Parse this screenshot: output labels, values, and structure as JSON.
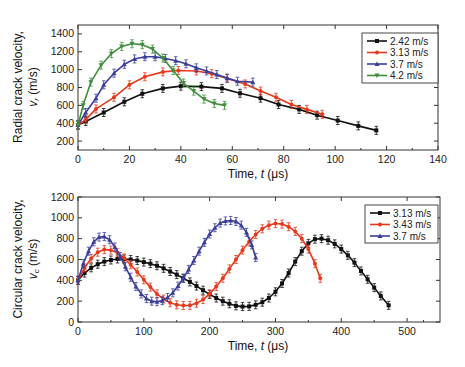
{
  "chart_data": [
    {
      "type": "line",
      "title": "",
      "xlabel": "Time, t (μs)",
      "xlabel_parts": {
        "prefix": "Time, ",
        "var": "t",
        "unit": " (μs)"
      },
      "ylabel": "Radial crack velocity, v_r (m/s)",
      "ylabel_line1": "Radial crack velocity,",
      "ylabel_line2_var": "v",
      "ylabel_line2_sub": "r",
      "ylabel_line2_unit": " (m/s)",
      "xlim": [
        0,
        140
      ],
      "ylim": [
        100,
        1500
      ],
      "xticks": [
        0,
        20,
        40,
        60,
        80,
        100,
        120,
        140
      ],
      "yticks": [
        200,
        400,
        600,
        800,
        1000,
        1200,
        1400
      ],
      "legend_position": "top-right",
      "grid": false,
      "series": [
        {
          "name": "2.42 m/s",
          "color": "#111111",
          "marker": "square",
          "x": [
            0,
            3,
            10,
            18,
            25,
            33,
            40,
            48,
            56,
            63,
            71,
            78,
            86,
            93,
            101,
            109,
            116
          ],
          "y": [
            380,
            420,
            520,
            640,
            730,
            790,
            815,
            810,
            790,
            735,
            680,
            610,
            555,
            490,
            430,
            370,
            320
          ]
        },
        {
          "name": "3.13 m/s",
          "color": "#e8391d",
          "marker": "circle",
          "x": [
            0,
            3,
            7,
            14,
            20,
            26,
            33,
            39,
            46,
            52,
            58,
            65,
            71,
            77,
            83,
            89,
            95
          ],
          "y": [
            380,
            440,
            560,
            690,
            830,
            920,
            975,
            990,
            985,
            955,
            900,
            840,
            760,
            690,
            610,
            555,
            500
          ]
        },
        {
          "name": "3.7 m/s",
          "color": "#3a3f9a",
          "marker": "triangle",
          "x": [
            0,
            3,
            7,
            10,
            14,
            18,
            22,
            26,
            30,
            34,
            38,
            42,
            46,
            50,
            54,
            58,
            62,
            68
          ],
          "y": [
            380,
            520,
            680,
            830,
            960,
            1060,
            1120,
            1145,
            1145,
            1125,
            1100,
            1065,
            1020,
            985,
            945,
            905,
            870,
            860
          ]
        },
        {
          "name": "4.2 m/s",
          "color": "#3f8f3a",
          "marker": "triangle-down",
          "x": [
            0,
            2,
            5,
            9,
            13,
            17,
            21,
            25,
            29,
            33,
            37,
            41,
            45,
            49,
            53,
            57
          ],
          "y": [
            380,
            600,
            860,
            1050,
            1180,
            1260,
            1290,
            1280,
            1230,
            1130,
            990,
            850,
            760,
            670,
            620,
            600
          ]
        }
      ]
    },
    {
      "type": "line",
      "title": "",
      "xlabel": "Time, t (μs)",
      "xlabel_parts": {
        "prefix": "Time, ",
        "var": "t",
        "unit": " (μs)"
      },
      "ylabel": "Circular crack velocity, v_c (m/s)",
      "ylabel_line1": "Circular crack velocity,",
      "ylabel_line2_var": "v",
      "ylabel_line2_sub": "c",
      "ylabel_line2_unit": " (m/s)",
      "xlim": [
        0,
        550
      ],
      "ylim": [
        0,
        1200
      ],
      "xticks": [
        0,
        100,
        200,
        300,
        400,
        500
      ],
      "yticks": [
        0,
        200,
        400,
        600,
        800,
        1000,
        1200
      ],
      "legend_position": "top-right",
      "grid": false,
      "series": [
        {
          "name": "3.13 m/s",
          "color": "#111111",
          "marker": "square",
          "x": [
            0,
            10,
            20,
            30,
            40,
            50,
            60,
            70,
            80,
            90,
            100,
            110,
            120,
            130,
            140,
            150,
            160,
            170,
            180,
            190,
            200,
            210,
            220,
            230,
            240,
            250,
            260,
            270,
            280,
            290,
            300,
            310,
            320,
            330,
            340,
            350,
            360,
            370,
            380,
            390,
            400,
            410,
            420,
            430,
            440,
            450,
            460,
            472
          ],
          "y": [
            400,
            470,
            520,
            555,
            580,
            595,
            605,
            605,
            600,
            590,
            575,
            560,
            540,
            515,
            485,
            455,
            420,
            385,
            345,
            305,
            265,
            230,
            200,
            175,
            155,
            148,
            150,
            165,
            190,
            230,
            290,
            370,
            470,
            580,
            680,
            755,
            795,
            800,
            785,
            750,
            700,
            640,
            570,
            490,
            410,
            330,
            250,
            160
          ]
        },
        {
          "name": "3.43 m/s",
          "color": "#e8391d",
          "marker": "circle",
          "x": [
            0,
            10,
            20,
            30,
            40,
            50,
            60,
            70,
            80,
            90,
            100,
            110,
            120,
            130,
            140,
            150,
            160,
            170,
            180,
            190,
            200,
            210,
            220,
            230,
            240,
            250,
            260,
            270,
            280,
            290,
            300,
            310,
            320,
            330,
            340,
            350,
            360,
            368
          ],
          "y": [
            400,
            520,
            610,
            670,
            695,
            690,
            665,
            615,
            550,
            480,
            405,
            335,
            270,
            220,
            185,
            165,
            158,
            160,
            180,
            215,
            270,
            340,
            420,
            510,
            600,
            690,
            770,
            840,
            895,
            930,
            945,
            940,
            915,
            870,
            800,
            700,
            560,
            420
          ]
        },
        {
          "name": "3.7 m/s",
          "color": "#3a3f9a",
          "marker": "triangle",
          "x": [
            0,
            8,
            16,
            24,
            32,
            40,
            48,
            56,
            64,
            72,
            80,
            88,
            96,
            104,
            112,
            120,
            128,
            136,
            144,
            152,
            160,
            168,
            176,
            184,
            192,
            200,
            208,
            216,
            224,
            232,
            240,
            248,
            256,
            264,
            270
          ],
          "y": [
            400,
            560,
            680,
            770,
            815,
            820,
            790,
            720,
            630,
            530,
            430,
            340,
            270,
            225,
            200,
            195,
            205,
            235,
            280,
            345,
            420,
            505,
            590,
            680,
            765,
            845,
            905,
            950,
            970,
            975,
            965,
            930,
            860,
            740,
            620
          ]
        }
      ]
    }
  ]
}
